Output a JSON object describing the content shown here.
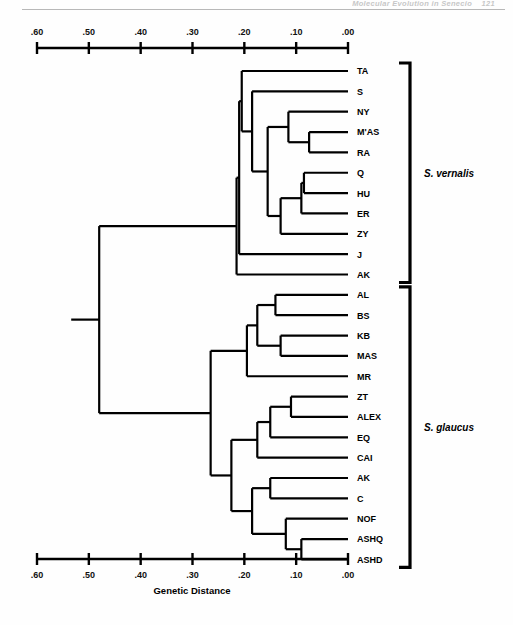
{
  "page": {
    "running_head": "Molecular Evolution in Senecio",
    "page_number": "121"
  },
  "figure": {
    "axis_title": "Genetic Distance",
    "tick_labels": [
      ".60",
      ".50",
      ".40",
      ".30",
      ".20",
      ".10",
      ".00"
    ],
    "species_groups": [
      {
        "name": "S. vernalis",
        "label_y": 160
      },
      {
        "name": "S. glaucus",
        "label_y": 420
      }
    ]
  },
  "chart_data": {
    "type": "dendrogram",
    "title": "",
    "xlabel": "Genetic Distance",
    "ylabel": "",
    "xlim": [
      0.6,
      0.0
    ],
    "x_ticks": [
      0.6,
      0.5,
      0.4,
      0.3,
      0.2,
      0.1,
      0.0
    ],
    "x_tick_labels": [
      ".60",
      ".50",
      ".40",
      ".30",
      ".20",
      ".10",
      ".00"
    ],
    "axis_reversed": true,
    "grid": false,
    "legend": "none",
    "leaves": [
      {
        "label": "TA",
        "group": "S. vernalis"
      },
      {
        "label": "S",
        "group": "S. vernalis"
      },
      {
        "label": "NY",
        "group": "S. vernalis"
      },
      {
        "label": "M'AS",
        "group": "S. vernalis"
      },
      {
        "label": "RA",
        "group": "S. vernalis"
      },
      {
        "label": "Q",
        "group": "S. vernalis"
      },
      {
        "label": "HU",
        "group": "S. vernalis"
      },
      {
        "label": "ER",
        "group": "S. vernalis"
      },
      {
        "label": "ZY",
        "group": "S. vernalis"
      },
      {
        "label": "J",
        "group": "S. vernalis"
      },
      {
        "label": "AK",
        "group": "S. vernalis"
      },
      {
        "label": "AL",
        "group": "S. glaucus"
      },
      {
        "label": "BS",
        "group": "S. glaucus"
      },
      {
        "label": "KB",
        "group": "S. glaucus"
      },
      {
        "label": "MAS",
        "group": "S. glaucus"
      },
      {
        "label": "MR",
        "group": "S. glaucus"
      },
      {
        "label": "ZT",
        "group": "S. glaucus"
      },
      {
        "label": "ALEX",
        "group": "S. glaucus"
      },
      {
        "label": "EQ",
        "group": "S. glaucus"
      },
      {
        "label": "CAI",
        "group": "S. glaucus"
      },
      {
        "label": "AK",
        "group": "S. glaucus"
      },
      {
        "label": "C",
        "group": "S. glaucus"
      },
      {
        "label": "NOF",
        "group": "S. glaucus"
      },
      {
        "label": "ASHQ",
        "group": "S. glaucus"
      },
      {
        "label": "ASHD",
        "group": "S. glaucus"
      }
    ],
    "merges": [
      {
        "id": "n1",
        "children": [
          "M'AS",
          "RA"
        ],
        "distance": 0.075
      },
      {
        "id": "n2",
        "children": [
          "NY",
          "n1"
        ],
        "distance": 0.115
      },
      {
        "id": "n3",
        "children": [
          "Q",
          "HU"
        ],
        "distance": 0.085
      },
      {
        "id": "n4",
        "children": [
          "n3",
          "ER"
        ],
        "distance": 0.09
      },
      {
        "id": "n5",
        "children": [
          "n4",
          "ZY"
        ],
        "distance": 0.13
      },
      {
        "id": "n6",
        "children": [
          "n2",
          "n5"
        ],
        "distance": 0.155
      },
      {
        "id": "n7",
        "children": [
          "S",
          "n6"
        ],
        "distance": 0.185
      },
      {
        "id": "n8",
        "children": [
          "TA",
          "n7"
        ],
        "distance": 0.205
      },
      {
        "id": "n9",
        "children": [
          "n8",
          "J"
        ],
        "distance": 0.21
      },
      {
        "id": "n10",
        "children": [
          "n9",
          "AK"
        ],
        "distance": 0.215
      },
      {
        "id": "n11",
        "children": [
          "AL",
          "BS"
        ],
        "distance": 0.14
      },
      {
        "id": "n12",
        "children": [
          "KB",
          "MAS"
        ],
        "distance": 0.13
      },
      {
        "id": "n13",
        "children": [
          "n11",
          "n12"
        ],
        "distance": 0.175
      },
      {
        "id": "n14",
        "children": [
          "n13",
          "MR"
        ],
        "distance": 0.195
      },
      {
        "id": "n15",
        "children": [
          "ZT",
          "ALEX"
        ],
        "distance": 0.11
      },
      {
        "id": "n16",
        "children": [
          "n15",
          "EQ"
        ],
        "distance": 0.15
      },
      {
        "id": "n17",
        "children": [
          "n16",
          "CAI"
        ],
        "distance": 0.175
      },
      {
        "id": "n18",
        "children": [
          "AK2",
          "C"
        ],
        "distance": 0.15
      },
      {
        "id": "n19",
        "children": [
          "ASHQ",
          "ASHD"
        ],
        "distance": 0.09
      },
      {
        "id": "n20",
        "children": [
          "NOF",
          "n19"
        ],
        "distance": 0.12
      },
      {
        "id": "n21",
        "children": [
          "n18",
          "n20"
        ],
        "distance": 0.185
      },
      {
        "id": "n22",
        "children": [
          "n17",
          "n21"
        ],
        "distance": 0.225
      },
      {
        "id": "n23",
        "children": [
          "n14",
          "n22"
        ],
        "distance": 0.265
      },
      {
        "id": "root",
        "children": [
          "n10",
          "n23"
        ],
        "distance": 0.48
      }
    ]
  }
}
